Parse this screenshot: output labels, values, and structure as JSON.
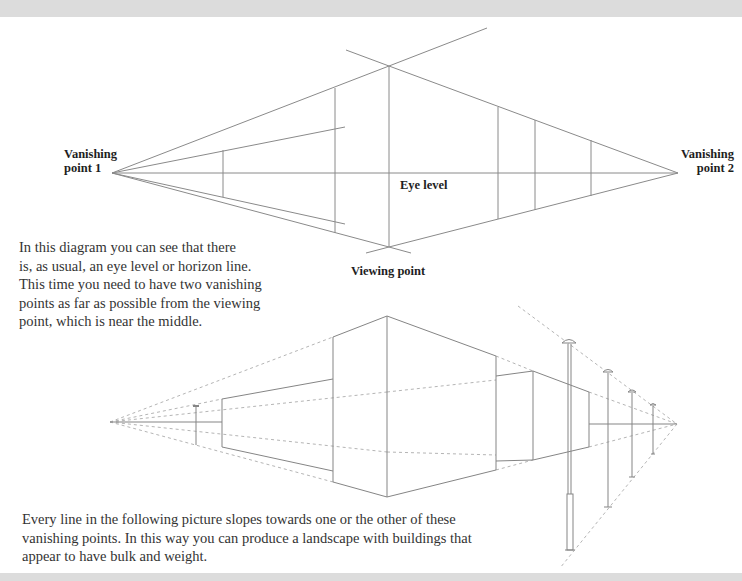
{
  "figure_top": {
    "labels": {
      "vp1_line1": "Vanishing",
      "vp1_line2": "point 1",
      "vp2_line1": "Vanishing",
      "vp2_line2": "point 2",
      "eye_level": "Eye level",
      "viewing_point": "Viewing point"
    },
    "caption": "In this diagram you can see that there is, as usual, an eye level or horizon line. This time you need to have two vanishing points as far as possible from the viewing point, which is near the middle.",
    "caption_lines": [
      "In this diagram you can see that there",
      "is, as usual, an eye level or horizon line.",
      "This time you need to have two vanishing",
      "points as far as possible from the viewing",
      "point, which is near the middle."
    ]
  },
  "figure_bottom": {
    "caption_lines": [
      "Every line in the following picture slopes towards one or the other of these",
      "vanishing points. In this way you can produce a landscape with buildings that",
      "appear to have bulk and weight."
    ]
  },
  "colors": {
    "line": "#8a8a8a",
    "guide": "#b5b5b5",
    "band": "#dcdcdc",
    "text": "#333333"
  }
}
